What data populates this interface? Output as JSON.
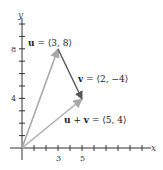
{
  "diagram": {
    "axes": {
      "x_label": "x",
      "y_label": "y",
      "x_ticks_labeled": [
        {
          "value": 3,
          "label": "3"
        },
        {
          "value": 5,
          "label": "5"
        }
      ],
      "y_ticks_labeled": [
        {
          "value": 4,
          "label": "4"
        },
        {
          "value": 8,
          "label": "8"
        }
      ],
      "x_range": [
        -1,
        11
      ],
      "y_range": [
        -1,
        11
      ]
    },
    "vectors": [
      {
        "name": "u",
        "from": [
          0,
          0
        ],
        "to": [
          3,
          8
        ],
        "color": "#a8a8a8",
        "label_bold": "u",
        "label_rest": " = ⟨3, 8⟩"
      },
      {
        "name": "v",
        "from": [
          3,
          8
        ],
        "to": [
          5,
          4
        ],
        "color": "#555555",
        "label_bold": "v",
        "label_rest": " = ⟨2, −4⟩"
      },
      {
        "name": "u+v",
        "from": [
          0,
          0
        ],
        "to": [
          5,
          4
        ],
        "color": "#b0b0b0",
        "label_bold_a": "u",
        "label_plus": " + ",
        "label_bold_b": "v",
        "label_rest": " = ⟨5, 4⟩"
      }
    ]
  }
}
